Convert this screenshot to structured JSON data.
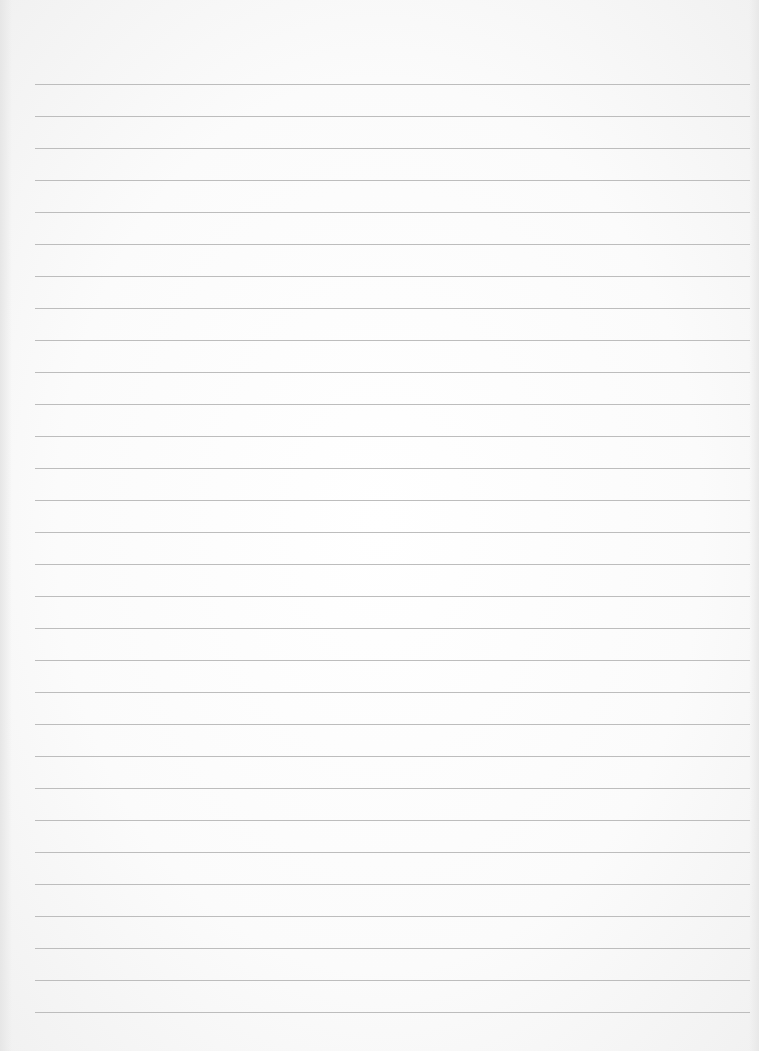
{
  "page": {
    "type": "lined-paper",
    "background_color": "#f7f7f7",
    "line_color": "#bdbdbd",
    "lines": {
      "count": 30,
      "first_y": 84,
      "spacing": 32,
      "left": 35,
      "right": 750
    }
  }
}
